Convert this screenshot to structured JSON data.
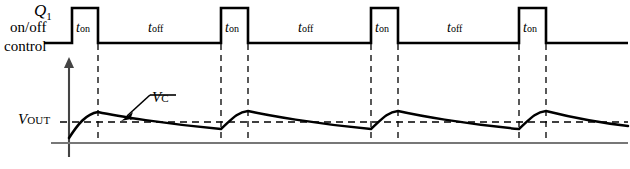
{
  "diagram": {
    "left_labels": {
      "device": "Q",
      "device_subscript": "1",
      "line2": "on/off",
      "line3": "control"
    },
    "vout_label": {
      "symbol": "V",
      "subscript": "OUT"
    },
    "vc_label": {
      "symbol": "V",
      "subscript": "C"
    },
    "interval_labels": {
      "on": {
        "symbol": "t",
        "subscript": "on"
      },
      "off": {
        "symbol": "t",
        "subscript": "off"
      }
    },
    "colors": {
      "trace": "#000000",
      "axis": "#555555",
      "dashed": "#000000",
      "background": "#ffffff"
    },
    "control_waveform": {
      "type": "square-pulse-train",
      "baseline_y": 43,
      "high_y": 8,
      "pulses": [
        {
          "start": 72,
          "end": 98
        },
        {
          "start": 221,
          "end": 248
        },
        {
          "start": 371,
          "end": 398
        },
        {
          "start": 519,
          "end": 546
        }
      ],
      "on_label_positions": [
        76,
        225,
        375,
        523
      ],
      "off_label_positions": [
        148,
        298,
        447
      ],
      "label_y": 20
    },
    "ripple_waveform": {
      "type": "sawtooth-ripple",
      "vout_level_y": 122,
      "peaks": [
        {
          "x": 98,
          "y": 112
        },
        {
          "x": 248,
          "y": 111
        },
        {
          "x": 398,
          "y": 111
        },
        {
          "x": 546,
          "y": 111
        }
      ],
      "valleys": [
        {
          "x": 221,
          "y": 129
        },
        {
          "x": 371,
          "y": 129
        },
        {
          "x": 519,
          "y": 129
        }
      ],
      "start_point": {
        "x": 69,
        "y": 138
      },
      "end_point": {
        "x": 628,
        "y": 126
      }
    },
    "axes": {
      "vertical_axis_x": 69,
      "vertical_axis_top": 57,
      "horizontal_axis_y": 143,
      "horizontal_axis_end": 628
    },
    "dashed_verticals": [
      98,
      221,
      248,
      371,
      398,
      519,
      546
    ]
  }
}
